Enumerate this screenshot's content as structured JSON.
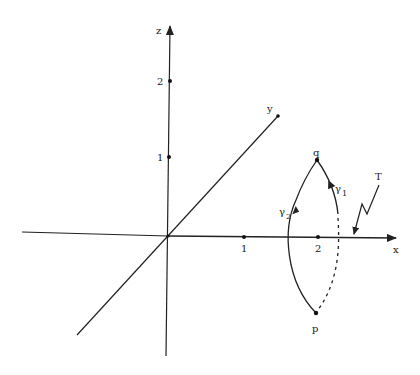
{
  "figure": {
    "axes": {
      "x": {
        "label": "x",
        "ticks": [
          "1",
          "2"
        ]
      },
      "y": {
        "label": "y"
      },
      "z": {
        "label": "z",
        "ticks": [
          "1",
          "2"
        ]
      }
    },
    "points": {
      "q": "q",
      "p": "p"
    },
    "curves": {
      "gamma1": {
        "symbol": "γ",
        "subscript": "1"
      },
      "gamma2": {
        "symbol": "γ",
        "subscript": "2"
      }
    },
    "annotation": {
      "T": "T"
    },
    "colors": {
      "ink": "#222222",
      "background": "#ffffff"
    }
  }
}
